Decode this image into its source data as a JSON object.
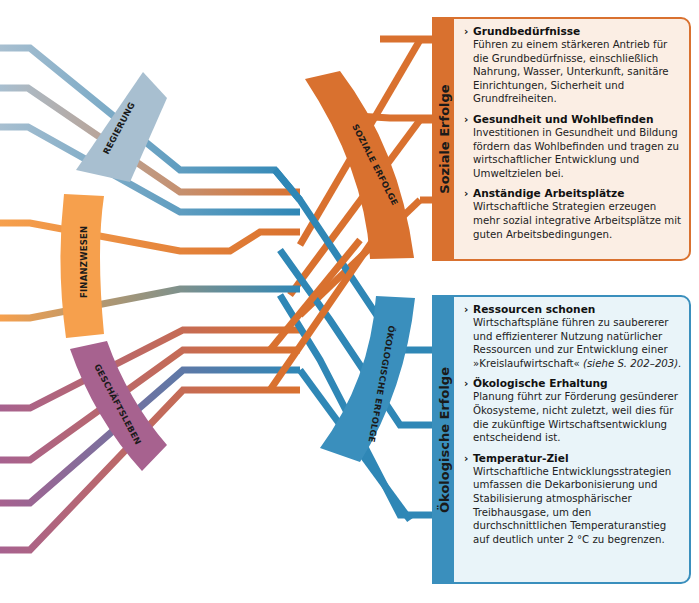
{
  "sources": [
    {
      "id": "regierung",
      "label": "REGIERUNG",
      "color": "#a8bfd0"
    },
    {
      "id": "finanzwesen",
      "label": "FINANZWESEN",
      "color": "#f6a04d"
    },
    {
      "id": "geschaeftsleben",
      "label": "GESCHÄFTSLEBEN",
      "color": "#a7628f"
    }
  ],
  "outcome_bands": [
    {
      "id": "soziale",
      "label": "SOZIALE ERFOLGE",
      "color": "#d9712f"
    },
    {
      "id": "oekologische",
      "label": "ÖKOLOGISCHE ERFOLGE",
      "color": "#3a8fbd"
    }
  ],
  "panels": {
    "social": {
      "heading": "Soziale Erfolge",
      "items": [
        {
          "title": "Grundbedürfnisse",
          "body": "Führen zu einem stärkeren Antrieb für die Grundbedürfnisse, einschließlich Nahrung, Wasser, Unterkunft, sanitäre Einrichtungen, Sicherheit und Grundfreiheiten."
        },
        {
          "title": "Gesundheit und Wohlbefinden",
          "body": "Investitionen in Gesundheit und Bildung fördern das Wohlbefinden und tragen zu wirtschaftlicher Entwicklung und Umweltzielen bei."
        },
        {
          "title": "Anständige Arbeitsplätze",
          "body": "Wirtschaftliche Strategien erzeugen mehr sozial integrative Arbeitsplätze mit guten Arbeitsbedingungen."
        }
      ]
    },
    "eco": {
      "heading": "Ökologische Erfolge",
      "items": [
        {
          "title": "Ressourcen schonen",
          "body": "Wirtschaftspläne führen zu saubererer und effizienterer Nutzung natürlicher Ressourcen und zur Entwicklung einer »Kreislaufwirtschaft«",
          "ref": "(siehe S. 202–203)."
        },
        {
          "title": "Ökologische Erhaltung",
          "body": "Planung führt zur Förderung gesünderer Ökosysteme, nicht zuletzt, weil dies für die zukünftige Wirtschaftsentwicklung entscheidend ist."
        },
        {
          "title": "Temperatur-Ziel",
          "body": "Wirtschaftliche Entwicklungsstrategien umfassen die Dekarbonisierung und Stabilisierung atmosphärischer Treibhausgase, um den durchschnittlichen Temperaturanstieg auf deutlich unter 2 °C zu begrenzen."
        }
      ]
    }
  },
  "icons": {
    "bullet": "chevron-right-icon"
  },
  "bullet_glyph": "›"
}
